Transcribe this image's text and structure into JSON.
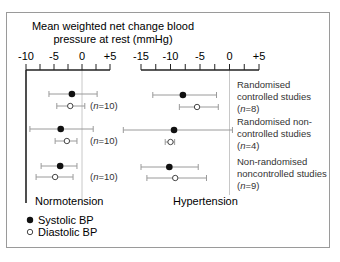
{
  "chart_data": {
    "type": "forest",
    "title_lines": [
      "Mean weighted net change blood",
      "pressure at rest (mmHg)"
    ],
    "panels": [
      {
        "name": "Normotension",
        "xlim": [
          -10,
          5
        ],
        "ticks": [
          -10,
          -5,
          0,
          5
        ],
        "tick_labels": [
          "-10",
          "-5",
          "0",
          "+5"
        ],
        "rows": [
          {
            "group": "Randomised controlled studies",
            "n_label": "(n=10)",
            "systolic": {
              "mean": -1.8,
              "lo": -5.9,
              "hi": 2.7
            },
            "diastolic": {
              "mean": -2.1,
              "lo": -4.5,
              "hi": 0.5
            }
          },
          {
            "group": "Randomised non-controlled studies",
            "n_label": "(n=10)",
            "systolic": {
              "mean": -3.8,
              "lo": -9.3,
              "hi": 2.0
            },
            "diastolic": {
              "mean": -2.7,
              "lo": -4.8,
              "hi": -0.9
            }
          },
          {
            "group": "Non-randomised noncontrolled studies",
            "n_label": "(n=10)",
            "systolic": {
              "mean": -3.9,
              "lo": -7.3,
              "hi": -0.9
            },
            "diastolic": {
              "mean": -4.8,
              "lo": -8.2,
              "hi": -1.6
            }
          }
        ]
      },
      {
        "name": "Hypertension",
        "xlim": [
          -15,
          5
        ],
        "ticks": [
          -15,
          -10,
          -5,
          0,
          5
        ],
        "tick_labels": [
          "-15",
          "-10",
          "-5",
          "0",
          "+5"
        ],
        "rows": [
          {
            "group": "Randomised controlled studies",
            "n_label": "(n=8)",
            "systolic": {
              "mean": -7.9,
              "lo": -13.0,
              "hi": -2.2
            },
            "diastolic": {
              "mean": -5.5,
              "lo": -8.5,
              "hi": -1.9
            }
          },
          {
            "group": "Randomised non-controlled studies",
            "n_label": "(n=4)",
            "systolic": {
              "mean": -9.4,
              "lo": -18.0,
              "hi": 0.5
            },
            "diastolic": {
              "mean": -10.0,
              "lo": -10.9,
              "hi": -9.3
            }
          },
          {
            "group": "Non-randomised noncontrolled studies",
            "n_label": "(n=9)",
            "systolic": {
              "mean": -10.2,
              "lo": -15.0,
              "hi": -5.3
            },
            "diastolic": {
              "mean": -9.2,
              "lo": -14.0,
              "hi": -3.9
            }
          }
        ]
      }
    ],
    "groups": [
      {
        "lines": [
          "Randomised",
          "controlled studies"
        ],
        "n": "8"
      },
      {
        "lines": [
          "Randomised non-",
          "controlled studies"
        ],
        "n": "4"
      },
      {
        "lines": [
          "Non-randomised",
          "noncontrolled studies"
        ],
        "n": "9"
      }
    ],
    "left_n_labels": [
      "(n=10)",
      "(n=10)",
      "(n=10)"
    ],
    "legend": [
      {
        "label": "Systolic BP",
        "marker": "filled-circle"
      },
      {
        "label": "Diastolic BP",
        "marker": "open-circle"
      }
    ],
    "colors": {
      "marker": "#111111",
      "whisker": "#9a9a9a",
      "axis": "#222222",
      "zero_line": "#c8c8c8"
    }
  }
}
